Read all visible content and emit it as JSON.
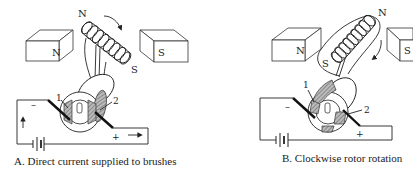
{
  "figure": {
    "panels": [
      {
        "id": "A",
        "caption": "A.  Direct current supplied to brushes",
        "magnets": {
          "left": "N",
          "right": "S"
        },
        "rotor_poles": {
          "top": "N",
          "bottom": "S"
        },
        "brushes": [
          "1",
          "2"
        ],
        "terminals": {
          "negative": "–",
          "positive": "+"
        },
        "current_arrows": [
          "up-arrow",
          "right-arrow"
        ],
        "rotation_arrow": "clockwise-arrow"
      },
      {
        "id": "B",
        "caption": "B.  Clockwise rotor rotation",
        "magnets": {
          "left": "N",
          "right": "S"
        },
        "rotor_poles": {
          "top": "N",
          "bottom": "S"
        },
        "brushes": [
          "1",
          "2"
        ],
        "terminals": {
          "negative": "–",
          "positive": "+"
        },
        "rotation_arrow": "clockwise-arrow"
      }
    ]
  }
}
